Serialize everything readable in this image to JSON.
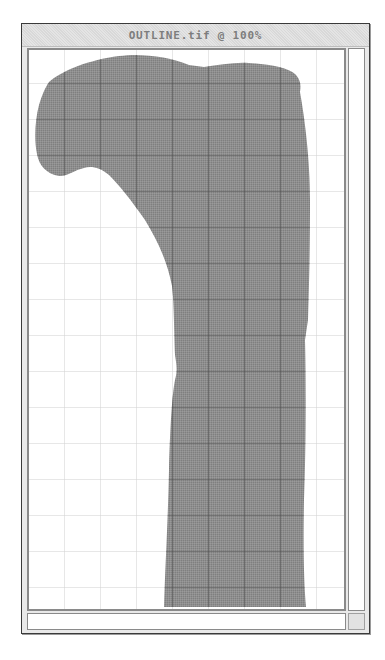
{
  "window": {
    "title": "OUTLINE.tif @ 100%",
    "document_name": "OUTLINE.tif",
    "zoom_level": "100%"
  },
  "canvas": {
    "grid_spacing_px": 36,
    "grid_color_light": "#cfcfcf",
    "grid_color_dark": "#5a5a5a",
    "shape_fill": "#8c8c8c",
    "background": "#ffffff",
    "shape_description": "gray outline silhouette (bone-like shape) with a small white triangular notch near the top"
  },
  "scrollbars": {
    "vertical": "vertical-scrollbar",
    "horizontal": "horizontal-scrollbar"
  },
  "colors": {
    "window_border": "#3a3a3a",
    "titlebar_bg": "#e4e4e4",
    "title_text": "#7d7d7d",
    "frame_border": "#8a8a8a"
  }
}
